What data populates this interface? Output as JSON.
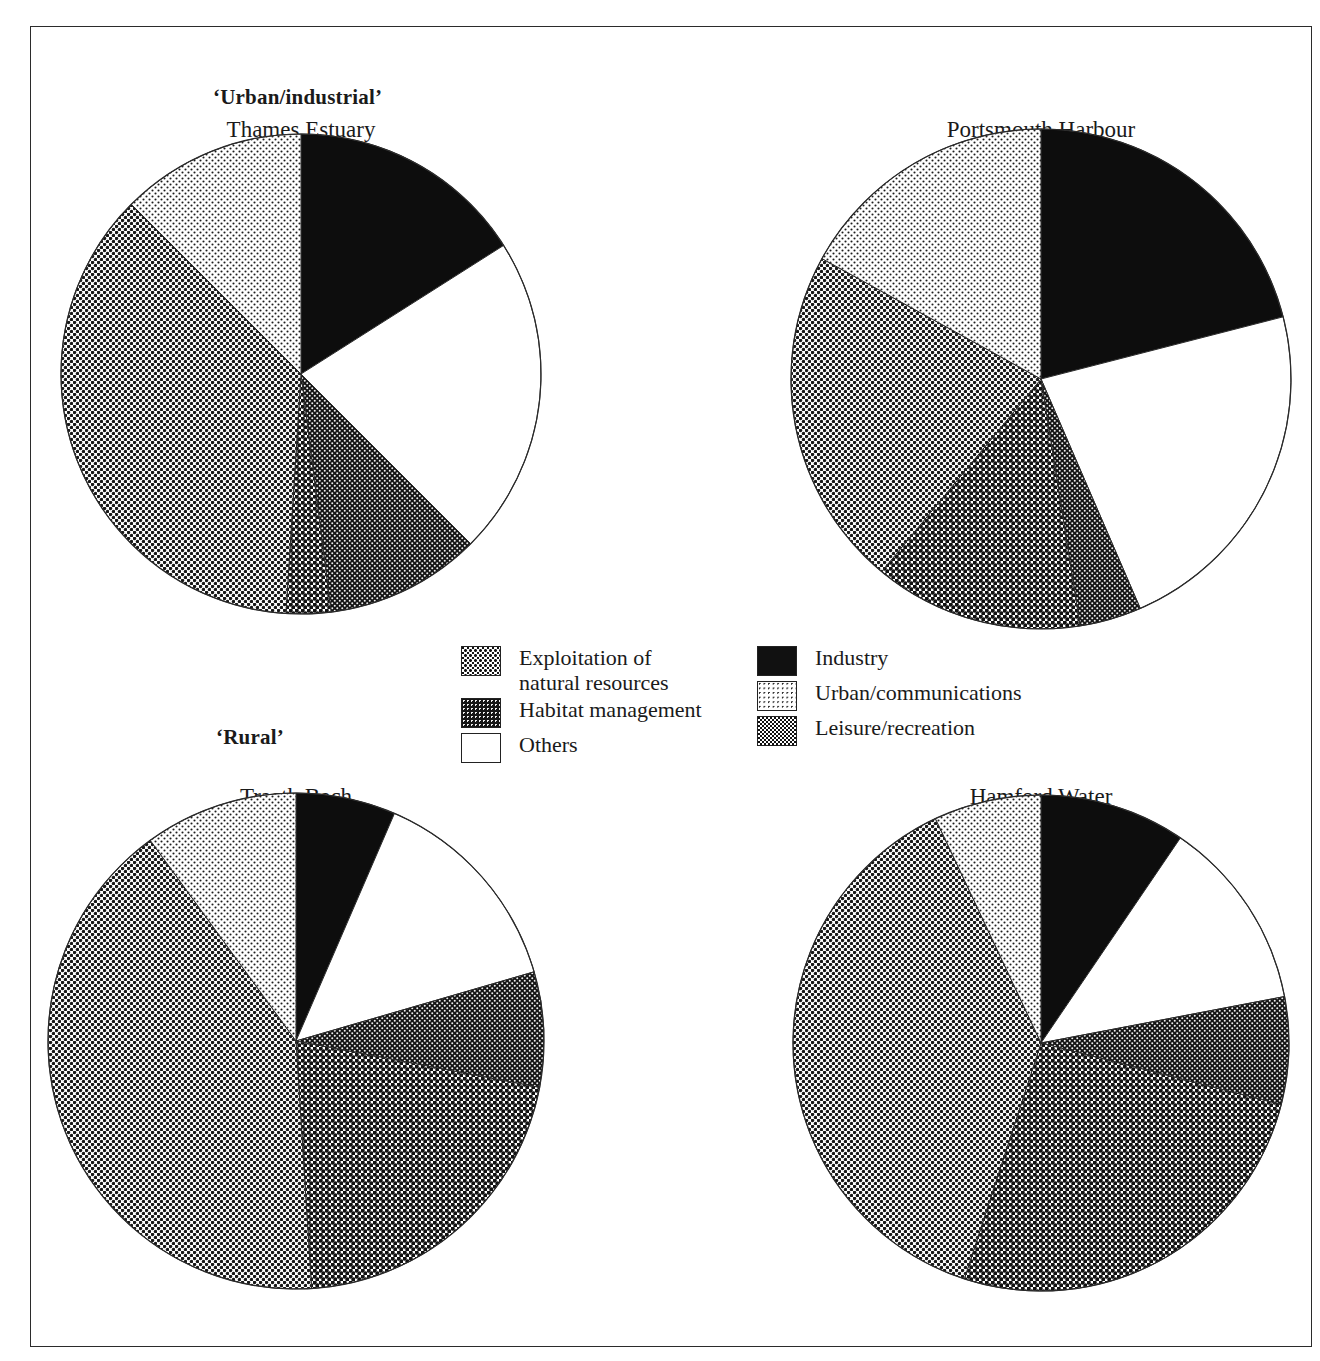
{
  "figure": {
    "group_labels": [
      {
        "id": "urban-industrial",
        "text": "‘Urban/industrial’"
      },
      {
        "id": "rural",
        "text": "‘Rural’"
      }
    ]
  },
  "legend": {
    "items": [
      {
        "key": "exploitation",
        "label": "Exploitation of\nnatural resources",
        "pattern": "sw-exploit",
        "column": "left"
      },
      {
        "key": "habitat",
        "label": "Habitat management",
        "pattern": "sw-habitat",
        "column": "left"
      },
      {
        "key": "others",
        "label": "Others",
        "pattern": "sw-others",
        "column": "left"
      },
      {
        "key": "industry",
        "label": "Industry",
        "pattern": "sw-industry",
        "column": "right"
      },
      {
        "key": "urban",
        "label": "Urban/communications",
        "pattern": "sw-urban",
        "column": "right"
      },
      {
        "key": "leisure",
        "label": "Leisure/recreation",
        "pattern": "sw-leisure",
        "column": "right"
      }
    ]
  },
  "colors": {
    "exploitation": "#6e6e6e",
    "habitat": "#2e2e2e",
    "others": "#ffffff",
    "industry": "#111111",
    "urban": "#d9d9d9",
    "leisure": "#9a9a9a",
    "outline": "#2b2b2b"
  },
  "chart_data": {
    "type": "pie",
    "categories": [
      "Industry",
      "Others",
      "Habitat management",
      "Exploitation of natural resources",
      "Leisure/recreation",
      "Urban/communications"
    ],
    "legend_position": "center",
    "units": "percent",
    "note": "Each pie sums to 100%. Slices run clockwise from 12 o'clock in the order listed.",
    "charts": [
      {
        "id": "thames-estuary",
        "title": "Thames Estuary",
        "group": "‘Urban/industrial’",
        "start_angle_deg": 0,
        "slices": [
          {
            "category": "Industry",
            "value": 16.0
          },
          {
            "category": "Others",
            "value": 21.5
          },
          {
            "category": "Habitat management",
            "value": 10.5
          },
          {
            "category": "Exploitation of natural resources",
            "value": 3.0
          },
          {
            "category": "Leisure/recreation",
            "value": 36.5
          },
          {
            "category": "Urban/communications",
            "value": 12.5
          }
        ]
      },
      {
        "id": "portsmouth-harbour",
        "title": "Portsmouth Harbour",
        "group": "‘Urban/industrial’",
        "start_angle_deg": 0,
        "slices": [
          {
            "category": "Industry",
            "value": 21.0
          },
          {
            "category": "Others",
            "value": 22.5
          },
          {
            "category": "Habitat management",
            "value": 4.0
          },
          {
            "category": "Exploitation of natural resources",
            "value": 13.5
          },
          {
            "category": "Leisure/recreation",
            "value": 22.0
          },
          {
            "category": "Urban/communications",
            "value": 17.0
          }
        ]
      },
      {
        "id": "traeth-bach",
        "title": "Traeth Bach",
        "group": "‘Rural’",
        "start_angle_deg": 0,
        "slices": [
          {
            "category": "Industry",
            "value": 6.5
          },
          {
            "category": "Others",
            "value": 14.0
          },
          {
            "category": "Habitat management",
            "value": 7.5
          },
          {
            "category": "Exploitation of natural resources",
            "value": 21.0
          },
          {
            "category": "Leisure/recreation",
            "value": 41.0
          },
          {
            "category": "Urban/communications",
            "value": 10.0
          }
        ]
      },
      {
        "id": "hamford-water",
        "title": "Hamford Water",
        "group": "‘Rural’",
        "start_angle_deg": 0,
        "slices": [
          {
            "category": "Industry",
            "value": 9.5
          },
          {
            "category": "Others",
            "value": 12.5
          },
          {
            "category": "Habitat management",
            "value": 7.0
          },
          {
            "category": "Exploitation of natural resources",
            "value": 26.0
          },
          {
            "category": "Leisure/recreation",
            "value": 38.0
          },
          {
            "category": "Urban/communications",
            "value": 7.0
          }
        ]
      }
    ]
  },
  "layout": {
    "pies": [
      {
        "id": "thames-estuary",
        "cx": 270,
        "cy": 347,
        "r": 240,
        "title_x": 270,
        "title_y": 90
      },
      {
        "id": "portsmouth-harbour",
        "cx": 1010,
        "cy": 352,
        "r": 250,
        "title_x": 1010,
        "title_y": 90
      },
      {
        "id": "traeth-bach",
        "cx": 265,
        "cy": 1014,
        "r": 248,
        "title_x": 265,
        "title_y": 757
      },
      {
        "id": "hamford-water",
        "cx": 1010,
        "cy": 1016,
        "r": 248,
        "title_x": 1010,
        "title_y": 757
      }
    ],
    "group_label_pos": [
      {
        "id": "urban-industrial",
        "x": 182,
        "y": 58
      },
      {
        "id": "rural",
        "x": 185,
        "y": 698
      }
    ]
  }
}
